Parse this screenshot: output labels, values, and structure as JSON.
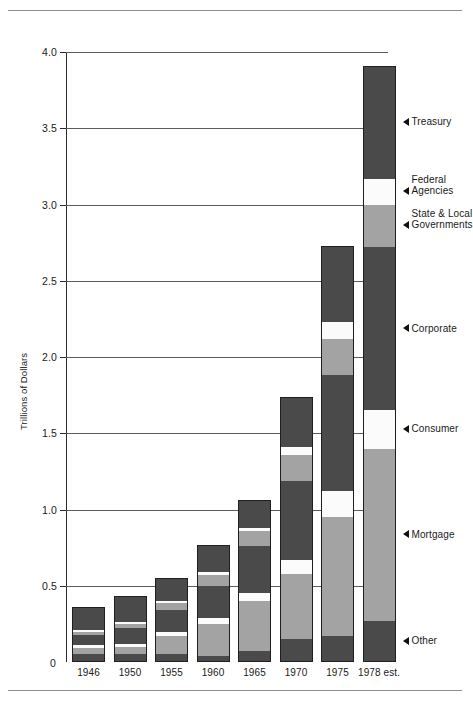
{
  "chart_data": {
    "type": "bar",
    "subtype": "stacked",
    "title": "",
    "xlabel": "",
    "ylabel": "Trillions of Dollars",
    "ylim": [
      0,
      4.0
    ],
    "ytick_labels": [
      "0",
      "0.5",
      "1.0",
      "1.5",
      "2.0",
      "2.5",
      "3.0",
      "3.5",
      "4.0"
    ],
    "ytick_values": [
      0,
      0.5,
      1.0,
      1.5,
      2.0,
      2.5,
      3.0,
      3.5,
      4.0
    ],
    "grid": "horizontal",
    "legend_position": "right-callouts",
    "categories": [
      "1946",
      "1950",
      "1955",
      "1960",
      "1965",
      "1970",
      "1975",
      "1978 est."
    ],
    "series": [
      {
        "name": "Other",
        "color": "#4a4a4a",
        "values": [
          0.05,
          0.05,
          0.05,
          0.04,
          0.07,
          0.15,
          0.17,
          0.27
        ]
      },
      {
        "name": "Mortgage",
        "color": "#a3a3a3",
        "values": [
          0.04,
          0.05,
          0.12,
          0.21,
          0.33,
          0.43,
          0.78,
          1.13
        ]
      },
      {
        "name": "Consumer",
        "color": "#fbfbfb",
        "values": [
          0.02,
          0.02,
          0.03,
          0.04,
          0.05,
          0.09,
          0.17,
          0.25
        ]
      },
      {
        "name": "Corporate",
        "color": "#4a4a4a",
        "values": [
          0.07,
          0.1,
          0.14,
          0.21,
          0.31,
          0.52,
          0.76,
          1.07
        ]
      },
      {
        "name": "State & Local Governments",
        "color": "#a3a3a3",
        "values": [
          0.02,
          0.03,
          0.05,
          0.07,
          0.1,
          0.17,
          0.24,
          0.28
        ]
      },
      {
        "name": "Federal Agencies",
        "color": "#fbfbfb",
        "values": [
          0.01,
          0.01,
          0.01,
          0.02,
          0.02,
          0.05,
          0.11,
          0.17
        ]
      },
      {
        "name": "Treasury",
        "color": "#4a4a4a",
        "values": [
          0.15,
          0.17,
          0.15,
          0.18,
          0.18,
          0.33,
          0.5,
          0.74
        ]
      }
    ],
    "totals": [
      0.36,
      0.43,
      0.55,
      0.77,
      1.06,
      1.74,
      2.73,
      3.91
    ]
  },
  "callouts": [
    {
      "id": "treasury",
      "label_line1": "Treasury",
      "label_line2": ""
    },
    {
      "id": "federal",
      "label_line1": "Federal",
      "label_line2": "Agencies"
    },
    {
      "id": "statelocal",
      "label_line1": "State & Local",
      "label_line2": "Governments"
    },
    {
      "id": "corporate",
      "label_line1": "Corporate",
      "label_line2": ""
    },
    {
      "id": "consumer",
      "label_line1": "Consumer",
      "label_line2": ""
    },
    {
      "id": "mortgage",
      "label_line1": "Mortgage",
      "label_line2": ""
    },
    {
      "id": "other",
      "label_line1": "Other",
      "label_line2": ""
    }
  ]
}
